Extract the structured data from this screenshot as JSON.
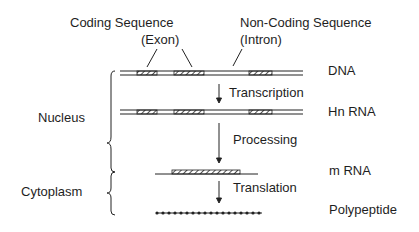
{
  "labels": {
    "coding_sequence": "Coding Sequence",
    "exon": "(Exon)",
    "noncoding_sequence": "Non-Coding Sequence",
    "intron": "(Intron)",
    "nucleus": "Nucleus",
    "cytoplasm": "Cytoplasm"
  },
  "stages": [
    {
      "name": "DNA"
    },
    {
      "name": "Hn RNA"
    },
    {
      "name": "m RNA"
    },
    {
      "name": "Polypeptide"
    }
  ],
  "processes": [
    {
      "name": "Transcription"
    },
    {
      "name": "Processing"
    },
    {
      "name": "Translation"
    }
  ]
}
